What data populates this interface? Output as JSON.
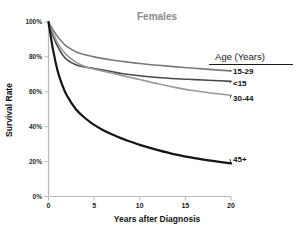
{
  "chart_data": {
    "type": "line",
    "title": "Females",
    "xlabel": "Years after Diagnosis",
    "ylabel": "Survival Rate",
    "xlim": [
      0,
      20
    ],
    "ylim": [
      0,
      100
    ],
    "xticks": [
      "0",
      "5",
      "10",
      "15",
      "20"
    ],
    "xtick_values": [
      0,
      5,
      10,
      15,
      20
    ],
    "yticks": [
      "0%",
      "20%",
      "40%",
      "60%",
      "80%",
      "100%"
    ],
    "ytick_values": [
      0,
      20,
      40,
      60,
      80,
      100
    ],
    "grid": false,
    "legend_position": "right-inline-labels",
    "legend_title": "Age (Years)",
    "x": [
      0,
      0.5,
      1,
      1.5,
      2,
      3,
      4,
      5,
      6,
      7,
      8,
      9,
      10,
      12,
      14,
      16,
      18,
      20
    ],
    "series": [
      {
        "name": "15-29",
        "label": "15-29",
        "color": "#7a7a7a",
        "linewidth": 1.6,
        "values": [
          100,
          95.5,
          91.5,
          88.5,
          86,
          83,
          81.2,
          80,
          79,
          78.2,
          77.5,
          76.8,
          76.2,
          75.2,
          74.3,
          73.5,
          72.7,
          72.0
        ]
      },
      {
        "name": "<15",
        "label": "<15",
        "color": "#4a4a4a",
        "linewidth": 1.6,
        "values": [
          100,
          92,
          86,
          81.5,
          78.5,
          75.5,
          74.2,
          73.4,
          72.5,
          71.5,
          70.5,
          69.8,
          69.2,
          68.2,
          67.5,
          67.0,
          66.5,
          66.0
        ]
      },
      {
        "name": "30-44",
        "label": "30-44",
        "color": "#9a9a9a",
        "linewidth": 1.6,
        "values": [
          100,
          93.5,
          88,
          84,
          81,
          77,
          74.5,
          73,
          71.8,
          70.6,
          69.4,
          68.2,
          67.0,
          64.6,
          62.4,
          60.6,
          59.2,
          58.0
        ]
      },
      {
        "name": "45+",
        "label": "45+",
        "color": "#151515",
        "linewidth": 2.2,
        "values": [
          100,
          84,
          72,
          64,
          58,
          50,
          45,
          41,
          38,
          35.5,
          33.3,
          31.4,
          29.6,
          26.6,
          24.0,
          22.0,
          20.4,
          19.0
        ]
      }
    ]
  },
  "colors": {
    "background": "#ffffff",
    "axis": "#b9b9b9",
    "title": "#8a8a8a",
    "text": "#111111"
  }
}
